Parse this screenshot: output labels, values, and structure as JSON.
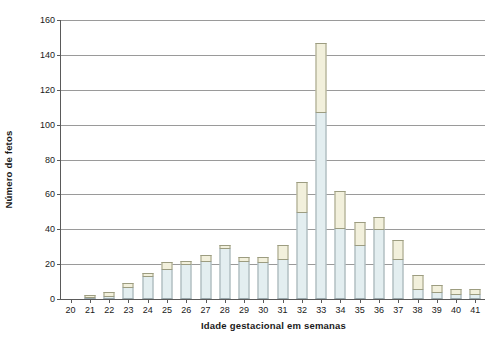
{
  "chart_data": {
    "type": "bar",
    "stacked": true,
    "title": "",
    "subtitle": "",
    "xlabel": "Idade gestacional em semanas",
    "ylabel": "Número de fetos",
    "categories": [
      "20",
      "21",
      "22",
      "23",
      "24",
      "25",
      "26",
      "27",
      "28",
      "29",
      "30",
      "31",
      "32",
      "33",
      "34",
      "35",
      "36",
      "37",
      "38",
      "39",
      "40",
      "41"
    ],
    "series": [
      {
        "name": "lower",
        "color": "#e3eef0",
        "values": [
          0,
          1,
          2,
          7,
          13,
          17,
          20,
          22,
          29,
          22,
          21,
          23,
          50,
          107,
          41,
          31,
          40,
          23,
          6,
          4,
          3,
          3
        ]
      },
      {
        "name": "upper",
        "color": "#f2f0dc",
        "values": [
          0,
          1,
          2,
          2,
          2,
          4,
          2,
          3,
          2,
          2,
          3,
          8,
          17,
          40,
          21,
          13,
          7,
          11,
          8,
          4,
          3,
          3
        ]
      }
    ],
    "totals": [
      0,
      2,
      4,
      9,
      15,
      21,
      22,
      25,
      31,
      24,
      24,
      31,
      67,
      147,
      62,
      44,
      47,
      34,
      14,
      8,
      6,
      6
    ],
    "ylim": [
      0,
      160
    ],
    "yticks": [
      0,
      20,
      40,
      60,
      80,
      100,
      120,
      140,
      160
    ],
    "ytick_labels": [
      "0",
      "20",
      "40",
      "60",
      "80",
      "100",
      "120",
      "140",
      "160"
    ],
    "grid": true,
    "grid_axis": "y",
    "legend": null,
    "legend_position": "none",
    "colors": {
      "lower_fill": "#e3eef0",
      "upper_fill": "#f2f0dc",
      "bar_outline": "#8e8e74",
      "gridline": "#9a9a9a",
      "axis": "#5a5a5a",
      "background": "#ffffff",
      "text": "#1a1a1a"
    }
  }
}
